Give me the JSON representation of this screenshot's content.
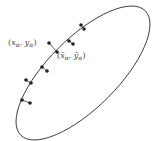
{
  "diagram": {
    "type": "ellipse-fit-projection",
    "colors": {
      "ellipse": "#333333",
      "point": "#222222",
      "connector": "#333333",
      "label": "#444444",
      "background": "#ffffff"
    },
    "ellipse": {
      "cx": 83,
      "cy": 73,
      "rx": 88,
      "ry": 35,
      "rotation_deg": -45
    },
    "point_pairs": [
      {
        "data": {
          "x": 81,
          "y": 25
        },
        "foot": {
          "x": 84,
          "y": 29
        }
      },
      {
        "data": {
          "x": 73,
          "y": 44
        },
        "foot": {
          "x": 69,
          "y": 41
        }
      },
      {
        "data": {
          "x": 49,
          "y": 43
        },
        "foot": {
          "x": 57,
          "y": 52
        }
      },
      {
        "data": {
          "x": 47,
          "y": 71
        },
        "foot": {
          "x": 42,
          "y": 67
        }
      },
      {
        "data": {
          "x": 26,
          "y": 80
        },
        "foot": {
          "x": 31,
          "y": 83
        }
      },
      {
        "data": {
          "x": 30,
          "y": 103
        },
        "foot": {
          "x": 22,
          "y": 100
        }
      }
    ],
    "labels": {
      "data_point": {
        "open": "(",
        "x": "x",
        "x_sub": "α",
        "sep": ", ",
        "y": "y",
        "y_sub": "α",
        "close": ")"
      },
      "foot_point": {
        "open": "(",
        "x": "x̄",
        "x_sub": "α",
        "sep": ", ",
        "y": "ȳ",
        "y_sub": "α",
        "close": ")"
      }
    }
  }
}
